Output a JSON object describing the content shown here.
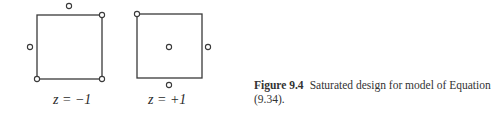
{
  "figure": {
    "label": "Figure 9.4",
    "caption": "Saturated design for model of Equation (9.34).",
    "panels": [
      {
        "z_label": "z = −1",
        "square": {
          "x": 37,
          "y": 15,
          "w": 65,
          "h": 64
        },
        "points": [
          {
            "cx": 69,
            "cy": 6
          },
          {
            "cx": 30,
            "cy": 47
          },
          {
            "cx": 37,
            "cy": 79
          },
          {
            "cx": 102,
            "cy": 79
          },
          {
            "cx": 102,
            "cy": 15
          }
        ]
      },
      {
        "z_label": "z = +1",
        "square": {
          "x": 137,
          "y": 14,
          "w": 65,
          "h": 64
        },
        "points": [
          {
            "cx": 137,
            "cy": 14
          },
          {
            "cx": 169,
            "cy": 47
          },
          {
            "cx": 208,
            "cy": 47
          },
          {
            "cx": 169,
            "cy": 85
          }
        ]
      }
    ]
  }
}
